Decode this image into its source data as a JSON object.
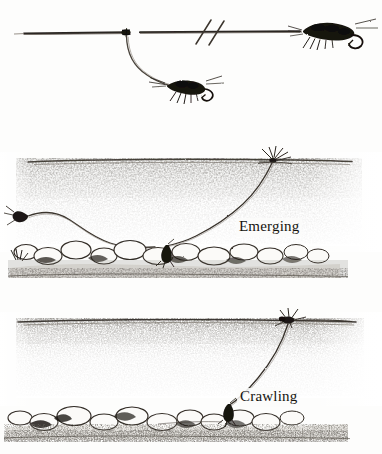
{
  "figure": {
    "background_color": "#fdfdfc",
    "ink_color": "#1a1714",
    "style": "pen-and-ink line drawing, scanned"
  },
  "panels": [
    {
      "id": "rig",
      "name": "dropper-rig",
      "description": "Horizontal leader with a break symbol, a dropper tippet knot, a trailing nymph fly below and a point nymph fly at the right end.",
      "elements": [
        {
          "name": "leader-line",
          "label": "leader"
        },
        {
          "name": "break-symbol",
          "label": "//"
        },
        {
          "name": "dropper-knot",
          "label": "dropper knot"
        },
        {
          "name": "dropper-tippet",
          "label": "dropper tippet"
        },
        {
          "name": "dropper-fly",
          "label": "nymph"
        },
        {
          "name": "point-fly",
          "label": "nymph"
        }
      ]
    },
    {
      "id": "emerging",
      "name": "emerging-panel",
      "label": "Emerging",
      "description": "Underwater cross-section: stippled water column, cobble streambed, fly line entering from the left, tippet rising to an emerging insect at the surface on the right.",
      "elements": [
        {
          "name": "water-surface-line",
          "label": "surface"
        },
        {
          "name": "streambed-rocks",
          "label": "cobble"
        },
        {
          "name": "fly-line",
          "label": "fly line"
        },
        {
          "name": "tippet",
          "label": "tippet"
        },
        {
          "name": "emerging-insect",
          "label": "emerger"
        },
        {
          "name": "nymph-on-bottom",
          "label": "nymph"
        }
      ]
    },
    {
      "id": "crawling",
      "name": "crawling-panel",
      "label": "Crawling",
      "description": "Underwater cross-section: insect crawling at the surface on the right, tippet descending to a nymph moving along the cobble streambed.",
      "elements": [
        {
          "name": "water-surface-line",
          "label": "surface"
        },
        {
          "name": "streambed-rocks",
          "label": "cobble"
        },
        {
          "name": "crawling-insect",
          "label": "crawler"
        },
        {
          "name": "tippet",
          "label": "tippet"
        },
        {
          "name": "nymph-on-bottom",
          "label": "nymph"
        }
      ]
    }
  ],
  "labels": {
    "emerging": "Emerging",
    "crawling": "Crawling"
  },
  "caption": {
    "smudge_text": "············"
  }
}
